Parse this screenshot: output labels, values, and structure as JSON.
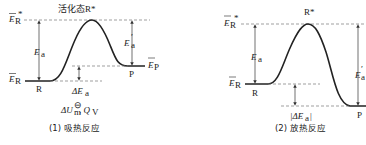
{
  "diagrams": [
    {
      "id": "endothermic",
      "caption": "(1) 吸热反应",
      "top_label": "活化态R*",
      "labels": {
        "E_R_star": "E",
        "E_R_star_sub": "R",
        "E_R_star_sup": "*",
        "E_R": "E",
        "E_R_sub": "R",
        "E_P": "E",
        "E_P_sub": "P",
        "Ea": "E",
        "Ea_sub": "a",
        "Ea_prime": "E",
        "Ea_prime_sub": "a",
        "Ea_prime_sup": "′",
        "R": "R",
        "P": "P",
        "delta_Ea": "ΔE",
        "delta_Ea_sub": "a",
        "thermo": "ΔU",
        "thermo_sub": "m",
        "thermo_sup": "⊖",
        "thermo_rest": ", Q",
        "thermo_rest_sub": "V"
      }
    },
    {
      "id": "exothermic",
      "caption": "(2) 放热反应",
      "top_label": "R*",
      "labels": {
        "E_R_star": "E",
        "E_R_star_sub": "R",
        "E_R_star_sup": "*",
        "E_R": "E",
        "E_R_sub": "R",
        "Ea": "E",
        "Ea_sub": "a",
        "Ea_prime": "E",
        "Ea_prime_sub": "a",
        "Ea_prime_sup": "′",
        "R": "R",
        "P": "P",
        "delta_Ea": "|ΔE",
        "delta_Ea_sub": "a",
        "delta_Ea_close": "|"
      }
    }
  ]
}
